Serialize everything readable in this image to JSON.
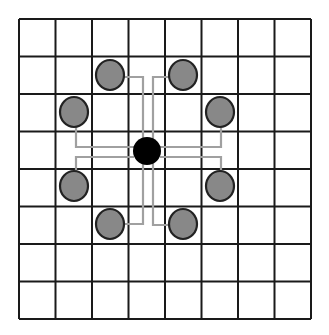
{
  "diagram": {
    "grid": {
      "columns": 8,
      "rows": 8,
      "x0": 19,
      "y0": 19,
      "x1": 311,
      "y1": 319,
      "line_color": "#1a1a1a"
    },
    "center_node": {
      "cx": 147,
      "cy": 151,
      "r": 14,
      "color": "#000000"
    },
    "neighbor_color": "#888888",
    "neighbor_stroke": "#222222",
    "connector_color": "#a0a0a0",
    "neighbors": [
      {
        "id": "top-left",
        "cx": 110,
        "cy": 75,
        "path": "M124,77 L143,77 L143,140"
      },
      {
        "id": "top-right",
        "cx": 183,
        "cy": 75,
        "path": "M169,77 L153,77 L153,140"
      },
      {
        "id": "left",
        "cx": 74,
        "cy": 112,
        "path": "M76,127 L76,147 L134,147"
      },
      {
        "id": "right",
        "cx": 220,
        "cy": 112,
        "path": "M221,127 L221,147 L160,147"
      },
      {
        "id": "lower-left",
        "cx": 74,
        "cy": 186,
        "path": "M76,171 L76,157 L134,157"
      },
      {
        "id": "lower-right",
        "cx": 220,
        "cy": 186,
        "path": "M221,171 L221,157 L160,157"
      },
      {
        "id": "bottom-left",
        "cx": 110,
        "cy": 224,
        "path": "M124,224 L143,224 L143,163"
      },
      {
        "id": "bottom-right",
        "cx": 183,
        "cy": 224,
        "path": "M169,225 L153,225 L153,163"
      }
    ]
  }
}
